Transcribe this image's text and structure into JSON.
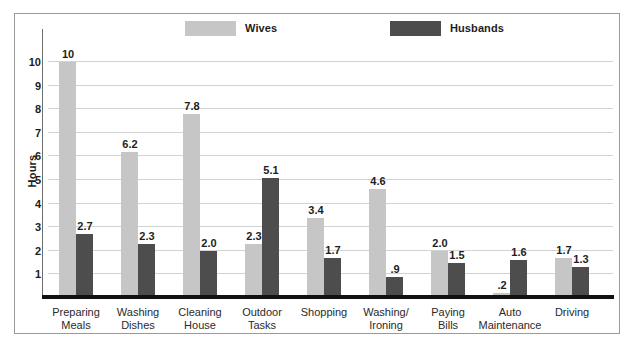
{
  "chart_data": {
    "type": "bar",
    "title": "",
    "xlabel": "",
    "ylabel": "Hours",
    "ylim": [
      0,
      10.8
    ],
    "yticks": [
      1,
      2,
      3,
      4,
      5,
      6,
      7,
      8,
      9,
      10
    ],
    "ytick_labels": [
      "1",
      "2",
      "3",
      "4",
      "5",
      "6",
      "7",
      "8",
      "9",
      "10"
    ],
    "grid": true,
    "legend_position": "top",
    "categories": [
      "Preparing Meals",
      "Washing Dishes",
      "Cleaning House",
      "Outdoor Tasks",
      "Shopping",
      "Washing/ Ironing",
      "Paying Bills",
      "Auto Maintenance",
      "Driving"
    ],
    "category_lines": [
      [
        "Preparing",
        "Meals"
      ],
      [
        "Washing",
        "Dishes"
      ],
      [
        "Cleaning",
        "House"
      ],
      [
        "Outdoor",
        "Tasks"
      ],
      [
        "Shopping",
        ""
      ],
      [
        "Washing/",
        "Ironing"
      ],
      [
        "Paying",
        "Bills"
      ],
      [
        "Auto",
        "Maintenance"
      ],
      [
        "Driving",
        ""
      ]
    ],
    "series": [
      {
        "name": "Wives",
        "color": "#c6c6c6",
        "values": [
          10,
          6.2,
          7.8,
          2.3,
          3.4,
          4.6,
          2.0,
          0.2,
          1.7
        ],
        "labels": [
          "10",
          "6.2",
          "7.8",
          "2.3",
          "3.4",
          "4.6",
          "2.0",
          ".2",
          "1.7"
        ]
      },
      {
        "name": "Husbands",
        "color": "#4d4d4d",
        "values": [
          2.7,
          2.3,
          2.0,
          5.1,
          1.7,
          0.9,
          1.5,
          1.6,
          1.3
        ],
        "labels": [
          "2.7",
          "2.3",
          "2.0",
          "5.1",
          "1.7",
          ".9",
          "1.5",
          "1.6",
          "1.3"
        ]
      }
    ]
  },
  "legend": {
    "wives_label": "Wives",
    "husbands_label": "Husbands",
    "wives_color": "#c6c6c6",
    "husbands_color": "#4d4d4d"
  },
  "axis": {
    "y_title": "Hours"
  }
}
